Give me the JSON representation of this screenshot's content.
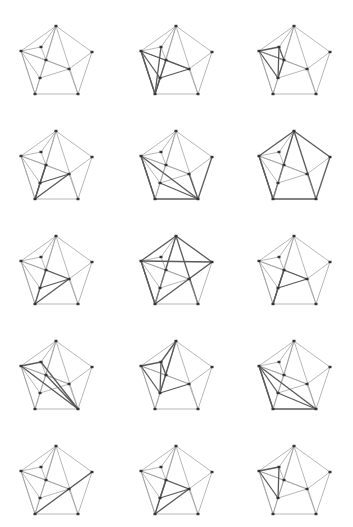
{
  "figure": {
    "layout": {
      "rows": 5,
      "cols": 3
    },
    "colors": {
      "background": "#ffffff",
      "edge": "#9a9a9a",
      "highlight_edge": "#5a5a5a",
      "node": "#333333"
    },
    "nodes": {
      "T": [
        56,
        26
      ],
      "R": [
        92,
        52
      ],
      "BR": [
        78,
        94
      ],
      "BL": [
        35,
        94
      ],
      "L": [
        21,
        51
      ],
      "a": [
        41,
        47
      ],
      "b": [
        46,
        60
      ],
      "c": [
        69,
        69
      ],
      "d": [
        40,
        78
      ]
    },
    "base_edges": [
      [
        "T",
        "R"
      ],
      [
        "R",
        "BR"
      ],
      [
        "BR",
        "BL"
      ],
      [
        "BL",
        "L"
      ],
      [
        "L",
        "T"
      ],
      [
        "T",
        "a"
      ],
      [
        "T",
        "b"
      ],
      [
        "T",
        "BR"
      ],
      [
        "T",
        "BL"
      ],
      [
        "L",
        "a"
      ],
      [
        "L",
        "b"
      ],
      [
        "L",
        "c"
      ],
      [
        "L",
        "d"
      ],
      [
        "L",
        "BL"
      ],
      [
        "b",
        "c"
      ],
      [
        "c",
        "R"
      ],
      [
        "c",
        "BR"
      ],
      [
        "d",
        "c"
      ],
      [
        "d",
        "BL"
      ],
      [
        "b",
        "d"
      ],
      [
        "a",
        "b"
      ]
    ],
    "panels": [
      {
        "id": 1,
        "highlight": []
      },
      {
        "id": 2,
        "highlight": [
          [
            "L",
            "c"
          ],
          [
            "L",
            "BL"
          ],
          [
            "b",
            "BL"
          ],
          [
            "d",
            "BL"
          ],
          [
            "b",
            "c"
          ],
          [
            "d",
            "c"
          ],
          [
            "L",
            "d"
          ],
          [
            "a",
            "BL"
          ]
        ]
      },
      {
        "id": 3,
        "highlight": [
          [
            "L",
            "a"
          ],
          [
            "L",
            "b"
          ],
          [
            "L",
            "d"
          ],
          [
            "a",
            "d"
          ],
          [
            "a",
            "b"
          ],
          [
            "b",
            "d"
          ]
        ]
      },
      {
        "id": 4,
        "highlight": [
          [
            "BL",
            "c"
          ],
          [
            "d",
            "c"
          ],
          [
            "BL",
            "d"
          ],
          [
            "BL",
            "b"
          ],
          [
            "d",
            "b"
          ]
        ]
      },
      {
        "id": 5,
        "highlight": [
          [
            "L",
            "BR"
          ],
          [
            "BL",
            "BR"
          ],
          [
            "R",
            "BR"
          ],
          [
            "L",
            "BL"
          ],
          [
            "d",
            "BR"
          ],
          [
            "c",
            "BR"
          ]
        ]
      },
      {
        "id": 6,
        "highlight": [
          [
            "T",
            "L"
          ],
          [
            "T",
            "R"
          ],
          [
            "T",
            "BR"
          ],
          [
            "T",
            "BL"
          ],
          [
            "L",
            "BL"
          ],
          [
            "BL",
            "BR"
          ],
          [
            "R",
            "BR"
          ]
        ]
      },
      {
        "id": 7,
        "highlight": [
          [
            "b",
            "c"
          ],
          [
            "d",
            "c"
          ],
          [
            "b",
            "d"
          ],
          [
            "BL",
            "c"
          ],
          [
            "BL",
            "d"
          ]
        ]
      },
      {
        "id": 8,
        "highlight": [
          [
            "T",
            "L"
          ],
          [
            "T",
            "R"
          ],
          [
            "T",
            "BL"
          ],
          [
            "T",
            "BR"
          ],
          [
            "L",
            "R"
          ],
          [
            "BL",
            "R"
          ],
          [
            "L",
            "BL"
          ]
        ]
      },
      {
        "id": 9,
        "highlight": [
          [
            "b",
            "c"
          ],
          [
            "b",
            "d"
          ],
          [
            "d",
            "c"
          ],
          [
            "BL",
            "b"
          ],
          [
            "BL",
            "d"
          ]
        ]
      },
      {
        "id": 10,
        "highlight": [
          [
            "L",
            "a"
          ],
          [
            "a",
            "BR"
          ],
          [
            "b",
            "BR"
          ],
          [
            "L",
            "BR"
          ]
        ]
      },
      {
        "id": 11,
        "highlight": [
          [
            "T",
            "a"
          ],
          [
            "T",
            "d"
          ],
          [
            "a",
            "d"
          ],
          [
            "L",
            "a"
          ],
          [
            "a",
            "b"
          ],
          [
            "d",
            "c"
          ],
          [
            "L",
            "d"
          ]
        ]
      },
      {
        "id": 12,
        "highlight": [
          [
            "L",
            "BR"
          ],
          [
            "L",
            "BL"
          ],
          [
            "BL",
            "BR"
          ],
          [
            "d",
            "BR"
          ],
          [
            "L",
            "d"
          ]
        ]
      },
      {
        "id": 13,
        "highlight": [
          [
            "BL",
            "R"
          ]
        ]
      },
      {
        "id": 14,
        "highlight": [
          [
            "b",
            "c"
          ],
          [
            "d",
            "c"
          ],
          [
            "b",
            "d"
          ],
          [
            "BL",
            "b"
          ],
          [
            "BL",
            "c"
          ]
        ]
      },
      {
        "id": 15,
        "highlight": [
          [
            "L",
            "a"
          ],
          [
            "a",
            "d"
          ],
          [
            "L",
            "d"
          ]
        ]
      }
    ]
  }
}
